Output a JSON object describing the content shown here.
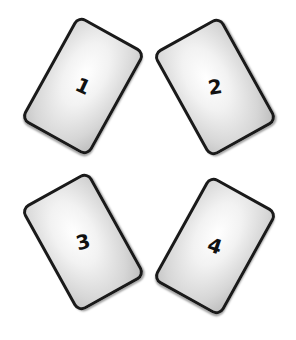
{
  "cards": [
    {
      "label": "1",
      "position": "top-left",
      "tilt": "right"
    },
    {
      "label": "2",
      "position": "top-right",
      "tilt": "left"
    },
    {
      "label": "3",
      "position": "bottom-left",
      "tilt": "left"
    },
    {
      "label": "4",
      "position": "bottom-right",
      "tilt": "right"
    }
  ],
  "colors": {
    "background": "#ffffff",
    "card_border": "#1a1a1a",
    "card_fill": "#e6e6e6",
    "number": "#111111"
  }
}
